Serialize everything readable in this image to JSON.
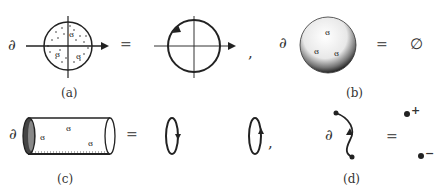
{
  "figure": {
    "panels": [
      {
        "id": "a",
        "caption": "(a)",
        "lhs_operator": "∂",
        "lhs": "disk with horizontal arrow axis and three swirl marks",
        "equals": "=",
        "rhs": "circle with counterclockwise arrow",
        "separator": ","
      },
      {
        "id": "b",
        "caption": "(b)",
        "lhs_operator": "∂",
        "lhs": "shaded sphere with swirl marks",
        "equals": "=",
        "rhs": "∅"
      },
      {
        "id": "c",
        "caption": "(c)",
        "lhs_operator": "∂",
        "lhs": "cylinder with swirl marks",
        "equals": "=",
        "rhs": "two oriented ellipses (down arrow, up arrow)",
        "separator": ","
      },
      {
        "id": "d",
        "caption": "(d)",
        "lhs_operator": "∂",
        "lhs": "oriented curve segment",
        "equals": "=",
        "rhs_points": [
          "+",
          "−"
        ]
      }
    ]
  }
}
